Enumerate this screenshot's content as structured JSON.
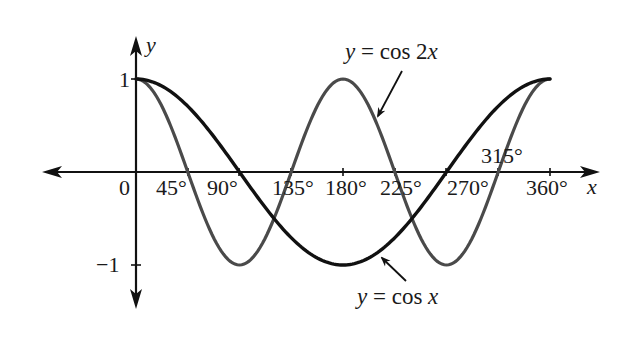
{
  "chart_data": {
    "type": "line",
    "title": "",
    "xlabel": "x",
    "ylabel": "y",
    "xlim": [
      0,
      360
    ],
    "ylim": [
      -1,
      1
    ],
    "grid": false,
    "legend": "annotations with arrows",
    "x_ticks": [
      0,
      45,
      90,
      135,
      180,
      225,
      270,
      315,
      360
    ],
    "x_tick_labels": [
      "0",
      "45°",
      "90°",
      "135°",
      "180°",
      "225°",
      "270°",
      "315°",
      "360°"
    ],
    "y_ticks": [
      1,
      -1
    ],
    "y_tick_labels": [
      "1",
      "−1"
    ],
    "series": [
      {
        "name": "y = cos x",
        "color": "#111111",
        "function": "cos(x)",
        "x": [
          0,
          45,
          90,
          135,
          180,
          225,
          270,
          315,
          360
        ],
        "values": [
          1,
          0.707,
          0,
          -0.707,
          -1,
          -0.707,
          0,
          0.707,
          1
        ]
      },
      {
        "name": "y = cos 2x",
        "color": "#4a4a4a",
        "function": "cos(2x)",
        "x": [
          0,
          45,
          90,
          135,
          180,
          225,
          270,
          315,
          360
        ],
        "values": [
          1,
          0,
          -1,
          0,
          1,
          0,
          -1,
          0,
          1
        ]
      }
    ],
    "annotations": [
      {
        "text": "y = cos 2x",
        "points_to_series": "y = cos 2x"
      },
      {
        "text": "y = cos x",
        "points_to_series": "y = cos x"
      }
    ]
  },
  "labels": {
    "y_axis": "y",
    "x_axis": "x",
    "origin": "0",
    "y_pos_one": "1",
    "y_neg_one": "−1",
    "tick_45": "45°",
    "tick_90": "90°",
    "tick_135": "135°",
    "tick_180": "180°",
    "tick_225": "225°",
    "tick_270": "270°",
    "tick_315": "315°",
    "tick_360": "360°",
    "cos2x_y": "y",
    "cos2x_eq": " = cos 2",
    "cos2x_x": "x",
    "cosx_y": "y",
    "cosx_eq": " = cos ",
    "cosx_x": "x"
  }
}
